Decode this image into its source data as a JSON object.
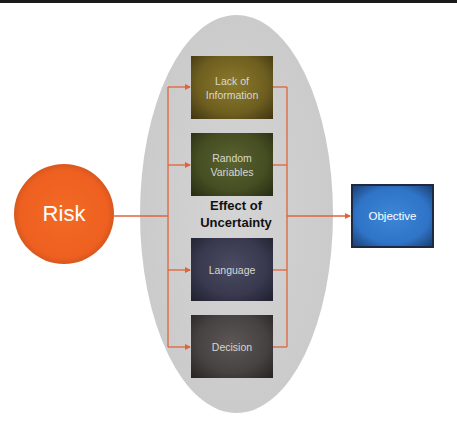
{
  "diagram": {
    "type": "flow",
    "source": {
      "label": "Risk",
      "color": "#ee6020"
    },
    "group": {
      "label_line1": "Effect of",
      "label_line2": "Uncertainty",
      "color": "#cbcbcb",
      "factors": [
        {
          "line1": "Lack of",
          "line2": "Information",
          "color": "#6e5f20"
        },
        {
          "line1": "Random",
          "line2": "Variables",
          "color": "#454d22"
        },
        {
          "line1": "Language",
          "line2": "",
          "color": "#38384e"
        },
        {
          "line1": "Decision",
          "line2": "",
          "color": "#474242"
        }
      ]
    },
    "target": {
      "label": "Objective",
      "color": "#2f74c6"
    },
    "connector_color": "#e0643a",
    "edges": [
      {
        "from": "Risk",
        "to": "Lack of Information"
      },
      {
        "from": "Risk",
        "to": "Random Variables"
      },
      {
        "from": "Risk",
        "to": "Language"
      },
      {
        "from": "Risk",
        "to": "Decision"
      },
      {
        "from": "Effect of Uncertainty",
        "to": "Objective"
      }
    ]
  }
}
